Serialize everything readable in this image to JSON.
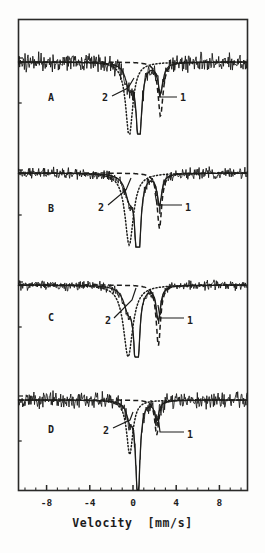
{
  "figure": {
    "name": "mossbauer-spectra-figure",
    "background_color": "#fdfdfc",
    "ink_color": "#1c1c1c"
  },
  "axis": {
    "x_title": "Velocity  [mm/s]",
    "x_ticks": [
      "-8",
      "-4",
      "0",
      "4",
      "8"
    ],
    "x_tick_values": [
      -8,
      -4,
      0,
      4,
      8
    ],
    "x_range": [
      -10.6,
      10.6
    ],
    "y_title": "",
    "y_ticks": []
  },
  "panels": [
    {
      "letter": "A",
      "annotations": [
        {
          "label": "2",
          "target": "left-dotted-subspectrum"
        },
        {
          "label": "1",
          "target": "right-solid-subspectrum"
        }
      ]
    },
    {
      "letter": "B",
      "annotations": [
        {
          "label": "2",
          "target": "left-dotted-subspectrum"
        },
        {
          "label": "1",
          "target": "right-solid-subspectrum"
        }
      ]
    },
    {
      "letter": "C",
      "annotations": [
        {
          "label": "2",
          "target": "left-dotted-subspectrum"
        },
        {
          "label": "1",
          "target": "right-solid-subspectrum"
        }
      ]
    },
    {
      "letter": "D",
      "annotations": [
        {
          "label": "2",
          "target": "left-dotted-subspectrum"
        },
        {
          "label": "1",
          "target": "right-solid-subspectrum"
        }
      ]
    }
  ],
  "chart_data": {
    "type": "line",
    "title": "",
    "xlabel": "Velocity  [mm/s]",
    "ylabel": "",
    "xlim": [
      -10.6,
      10.6
    ],
    "xticks": [
      -8,
      -4,
      0,
      4,
      8
    ],
    "grid": false,
    "legend": "none",
    "note": "Four stacked Mössbauer transmission spectra (A-D). Each panel shows a noisy measured spectrum plus two fitted quadrupole doublet subspectra: component 2 (dotted, inner/left line near -0.3 mm/s) and component 1 (dashed-solid, outer line near +2.5 mm/s).",
    "series": [
      {
        "name": "A",
        "panel": "A",
        "baseline": 1.0,
        "noise_amplitude": 0.085,
        "components": [
          {
            "id": "2",
            "style": "dotted",
            "center": -0.35,
            "width": 0.8,
            "depth": 0.95
          },
          {
            "id": "1",
            "style": "dashed",
            "center": 2.55,
            "width": 0.55,
            "depth": 0.7
          },
          {
            "id": "center",
            "style": "solid",
            "center": 0.55,
            "width": 0.55,
            "depth": 1.1
          }
        ]
      },
      {
        "name": "B",
        "panel": "B",
        "baseline": 1.0,
        "noise_amplitude": 0.045,
        "components": [
          {
            "id": "2",
            "style": "dotted",
            "center": -0.35,
            "width": 0.95,
            "depth": 0.8
          },
          {
            "id": "1",
            "style": "dashed",
            "center": 2.45,
            "width": 0.5,
            "depth": 0.62
          },
          {
            "id": "center",
            "style": "solid",
            "center": 0.45,
            "width": 0.48,
            "depth": 1.25
          }
        ]
      },
      {
        "name": "C",
        "panel": "C",
        "baseline": 1.0,
        "noise_amplitude": 0.038,
        "components": [
          {
            "id": "2",
            "style": "dotted",
            "center": -0.45,
            "width": 1.05,
            "depth": 0.78
          },
          {
            "id": "1",
            "style": "dashed",
            "center": 2.35,
            "width": 0.48,
            "depth": 0.66
          },
          {
            "id": "center",
            "style": "solid",
            "center": 0.35,
            "width": 0.46,
            "depth": 1.2
          }
        ]
      },
      {
        "name": "D",
        "panel": "D",
        "baseline": 1.0,
        "noise_amplitude": 0.075,
        "components": [
          {
            "id": "2",
            "style": "dotted",
            "center": -0.3,
            "width": 0.7,
            "depth": 0.7
          },
          {
            "id": "1",
            "style": "dashed",
            "center": 2.2,
            "width": 0.45,
            "depth": 0.45
          },
          {
            "id": "center",
            "style": "solid",
            "center": 0.45,
            "width": 0.45,
            "depth": 1.3
          }
        ]
      }
    ]
  }
}
